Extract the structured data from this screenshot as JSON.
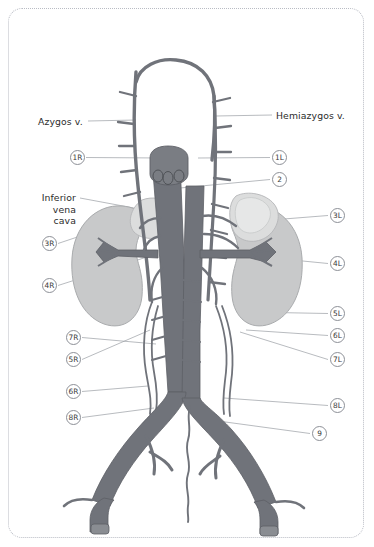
{
  "figure": {
    "frame_style": "dotted-rounded-border",
    "background_color": "#ffffff",
    "colors": {
      "vessel": "#70737a",
      "vessel_outline": "#5d6066",
      "kidney": "#c8c9ca",
      "kidney_outline": "#a9abad",
      "adrenal": "#dcdddd",
      "adrenal_outline": "#b4b6b8",
      "leader_line": "#9a9da4",
      "marker_outline": "#8d9097",
      "text": "#2b2b2b",
      "frame": "#b9bcc4"
    }
  },
  "text_labels": [
    {
      "id": "azygos",
      "text": "Azygos v.",
      "side": "left",
      "x": 38,
      "y": 116
    },
    {
      "id": "hemiazygos",
      "text": "Hemiazygos v.",
      "side": "right",
      "x": 276,
      "y": 110
    },
    {
      "id": "ivc",
      "text": "Inferior\nvena\ncava",
      "side": "left",
      "x": 24,
      "y": 192
    }
  ],
  "markers": [
    {
      "id": "1R",
      "label": "1R",
      "side": "left",
      "x": 70,
      "y": 150,
      "leader_to_x": 162,
      "leader_to_y": 158
    },
    {
      "id": "1L",
      "label": "1L",
      "side": "right",
      "x": 272,
      "y": 150,
      "leader_to_x": 198,
      "leader_to_y": 158
    },
    {
      "id": "2",
      "label": "2",
      "side": "right",
      "x": 272,
      "y": 172,
      "leader_to_x": 180,
      "leader_to_y": 188
    },
    {
      "id": "3R",
      "label": "3R",
      "side": "left",
      "x": 42,
      "y": 236,
      "leader_to_x": 152,
      "leader_to_y": 212
    },
    {
      "id": "3L",
      "label": "3L",
      "side": "right",
      "x": 330,
      "y": 208,
      "leader_to_x": 246,
      "leader_to_y": 222
    },
    {
      "id": "4R",
      "label": "4R",
      "side": "left",
      "x": 42,
      "y": 278,
      "leader_to_x": 150,
      "leader_to_y": 256
    },
    {
      "id": "4L",
      "label": "4L",
      "side": "right",
      "x": 330,
      "y": 256,
      "leader_to_x": 252,
      "leader_to_y": 256
    },
    {
      "id": "5R",
      "label": "5R",
      "side": "left",
      "x": 66,
      "y": 352,
      "leader_to_x": 150,
      "leader_to_y": 330
    },
    {
      "id": "5L",
      "label": "5L",
      "side": "right",
      "x": 330,
      "y": 306,
      "leader_to_x": 248,
      "leader_to_y": 312
    },
    {
      "id": "6R",
      "label": "6R",
      "side": "left",
      "x": 66,
      "y": 384,
      "leader_to_x": 148,
      "leader_to_y": 386
    },
    {
      "id": "6L",
      "label": "6L",
      "side": "right",
      "x": 330,
      "y": 328,
      "leader_to_x": 246,
      "leader_to_y": 330
    },
    {
      "id": "7R",
      "label": "7R",
      "side": "left",
      "x": 66,
      "y": 330,
      "leader_to_x": 156,
      "leader_to_y": 344
    },
    {
      "id": "7L",
      "label": "7L",
      "side": "right",
      "x": 330,
      "y": 352,
      "leader_to_x": 240,
      "leader_to_y": 332
    },
    {
      "id": "8R",
      "label": "8R",
      "side": "left",
      "x": 66,
      "y": 410,
      "leader_to_x": 154,
      "leader_to_y": 408
    },
    {
      "id": "8L",
      "label": "8L",
      "side": "right",
      "x": 330,
      "y": 398,
      "leader_to_x": 224,
      "leader_to_y": 398
    },
    {
      "id": "9",
      "label": "9",
      "side": "right",
      "x": 312,
      "y": 426,
      "leader_to_x": 196,
      "leader_to_y": 418
    }
  ],
  "structures": [
    {
      "name": "azygos-vein",
      "description": "right paravertebral vein arching over right main bronchus"
    },
    {
      "name": "hemiazygos-vein",
      "description": "left paravertebral vein with segmental tributaries"
    },
    {
      "name": "inferior-vena-cava",
      "description": "large vertical vein right of midline"
    },
    {
      "name": "abdominal-aorta",
      "description": "vertical vessel left of midline bifurcating into common iliacs"
    },
    {
      "name": "right-kidney",
      "description": "gray bean-shaped organ, left of figure"
    },
    {
      "name": "left-kidney",
      "description": "gray bean-shaped organ, right of figure"
    },
    {
      "name": "right-adrenal-gland",
      "description": "pale triangular gland atop right kidney"
    },
    {
      "name": "left-adrenal-gland",
      "description": "pale crescent gland atop left kidney"
    },
    {
      "name": "renal-veins",
      "description": "horizontal veins draining kidneys into IVC"
    },
    {
      "name": "common-iliac-vessels",
      "description": "paired vessels from bifurcation"
    },
    {
      "name": "median-sacral-vessel",
      "description": "thin wavy midline vessel below bifurcation"
    }
  ]
}
